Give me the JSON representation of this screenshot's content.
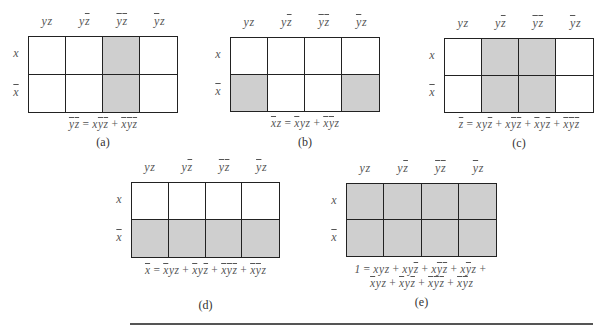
{
  "figure": {
    "column_headers": [
      [
        {
          "v": "y",
          "bar": false
        },
        {
          "v": "z",
          "bar": false
        }
      ],
      [
        {
          "v": "y",
          "bar": false
        },
        {
          "v": "z",
          "bar": true
        }
      ],
      [
        {
          "v": "y",
          "bar": true
        },
        {
          "v": "z",
          "bar": true
        }
      ],
      [
        {
          "v": "y",
          "bar": true
        },
        {
          "v": "z",
          "bar": false
        }
      ]
    ],
    "row_headers": [
      {
        "v": "x",
        "bar": false
      },
      {
        "v": "x",
        "bar": true
      }
    ],
    "shade_color": "#cfcfcf",
    "maps": [
      {
        "id": "a",
        "caption": "(a)",
        "pos": {
          "left": 28,
          "top": 36,
          "width": 150,
          "height": 77
        },
        "shaded": [
          [
            0,
            0,
            1,
            0
          ],
          [
            0,
            0,
            1,
            0
          ]
        ],
        "equation_lines": [
          [
            [
              {
                "v": "y",
                "bar": true
              },
              {
                "v": "z",
                "bar": true
              }
            ],
            "=",
            [
              {
                "v": "x",
                "bar": false
              },
              {
                "v": "y",
                "bar": true
              },
              {
                "v": "z",
                "bar": true
              }
            ],
            "+",
            [
              {
                "v": "x",
                "bar": true
              },
              {
                "v": "y",
                "bar": true
              },
              {
                "v": "z",
                "bar": true
              }
            ]
          ]
        ]
      },
      {
        "id": "b",
        "caption": "(b)",
        "pos": {
          "left": 230,
          "top": 37,
          "width": 150,
          "height": 75
        },
        "shaded": [
          [
            0,
            0,
            0,
            0
          ],
          [
            1,
            0,
            0,
            1
          ]
        ],
        "equation_lines": [
          [
            [
              {
                "v": "x",
                "bar": true
              },
              {
                "v": "z",
                "bar": false
              }
            ],
            "=",
            [
              {
                "v": "x",
                "bar": true
              },
              {
                "v": "y",
                "bar": false
              },
              {
                "v": "z",
                "bar": false
              }
            ],
            "+",
            [
              {
                "v": "x",
                "bar": true
              },
              {
                "v": "y",
                "bar": true
              },
              {
                "v": "z",
                "bar": false
              }
            ]
          ]
        ]
      },
      {
        "id": "c",
        "caption": "(c)",
        "pos": {
          "left": 444,
          "top": 38,
          "width": 150,
          "height": 75
        },
        "shaded": [
          [
            0,
            1,
            1,
            0
          ],
          [
            0,
            1,
            1,
            0
          ]
        ],
        "equation_lines": [
          [
            [
              {
                "v": "z",
                "bar": true
              }
            ],
            "=",
            [
              {
                "v": "x",
                "bar": false
              },
              {
                "v": "y",
                "bar": false
              },
              {
                "v": "z",
                "bar": true
              }
            ],
            "+",
            [
              {
                "v": "x",
                "bar": false
              },
              {
                "v": "y",
                "bar": true
              },
              {
                "v": "z",
                "bar": true
              }
            ],
            "+",
            [
              {
                "v": "x",
                "bar": true
              },
              {
                "v": "y",
                "bar": false
              },
              {
                "v": "z",
                "bar": true
              }
            ],
            "+",
            [
              {
                "v": "x",
                "bar": true
              },
              {
                "v": "y",
                "bar": true
              },
              {
                "v": "z",
                "bar": true
              }
            ]
          ]
        ]
      },
      {
        "id": "d",
        "caption": "(d)",
        "pos": {
          "left": 131,
          "top": 182,
          "width": 149,
          "height": 76
        },
        "shaded": [
          [
            0,
            0,
            0,
            0
          ],
          [
            1,
            1,
            1,
            1
          ]
        ],
        "equation_lines": [
          [
            [
              {
                "v": "x",
                "bar": true
              }
            ],
            "=",
            [
              {
                "v": "x",
                "bar": true
              },
              {
                "v": "y",
                "bar": false
              },
              {
                "v": "z",
                "bar": false
              }
            ],
            "+",
            [
              {
                "v": "x",
                "bar": true
              },
              {
                "v": "y",
                "bar": false
              },
              {
                "v": "z",
                "bar": true
              }
            ],
            "+",
            [
              {
                "v": "x",
                "bar": true
              },
              {
                "v": "y",
                "bar": true
              },
              {
                "v": "z",
                "bar": true
              }
            ],
            "+",
            [
              {
                "v": "x",
                "bar": true
              },
              {
                "v": "y",
                "bar": true
              },
              {
                "v": "z",
                "bar": false
              }
            ]
          ]
        ]
      },
      {
        "id": "e",
        "caption": "(e)",
        "pos": {
          "left": 346,
          "top": 183,
          "width": 151,
          "height": 74
        },
        "shaded": [
          [
            1,
            1,
            1,
            1
          ],
          [
            1,
            1,
            1,
            1
          ]
        ],
        "equation_lines": [
          [
            [
              {
                "v": "1",
                "bar": false
              }
            ],
            "=",
            [
              {
                "v": "x",
                "bar": false
              },
              {
                "v": "y",
                "bar": false
              },
              {
                "v": "z",
                "bar": false
              }
            ],
            "+",
            [
              {
                "v": "x",
                "bar": false
              },
              {
                "v": "y",
                "bar": false
              },
              {
                "v": "z",
                "bar": true
              }
            ],
            "+",
            [
              {
                "v": "x",
                "bar": false
              },
              {
                "v": "y",
                "bar": true
              },
              {
                "v": "z",
                "bar": true
              }
            ],
            "+",
            [
              {
                "v": "x",
                "bar": false
              },
              {
                "v": "y",
                "bar": true
              },
              {
                "v": "z",
                "bar": false
              }
            ],
            "+"
          ],
          [
            [
              {
                "v": "x",
                "bar": true
              },
              {
                "v": "y",
                "bar": false
              },
              {
                "v": "z",
                "bar": false
              }
            ],
            "+",
            [
              {
                "v": "x",
                "bar": true
              },
              {
                "v": "y",
                "bar": false
              },
              {
                "v": "z",
                "bar": true
              }
            ],
            "+",
            [
              {
                "v": "x",
                "bar": true
              },
              {
                "v": "y",
                "bar": true
              },
              {
                "v": "z",
                "bar": true
              }
            ],
            "+",
            [
              {
                "v": "x",
                "bar": true
              },
              {
                "v": "y",
                "bar": true
              },
              {
                "v": "z",
                "bar": false
              }
            ]
          ]
        ]
      }
    ],
    "layout": {
      "a": {
        "eq_top": 118,
        "cap_top": 135
      },
      "b": {
        "eq_top": 117,
        "cap_top": 135
      },
      "c": {
        "eq_top": 118,
        "cap_top": 136
      },
      "d": {
        "eq_top": 264,
        "cap_top": 298
      },
      "e": {
        "eq_top": 263,
        "cap_top": 295
      }
    }
  }
}
